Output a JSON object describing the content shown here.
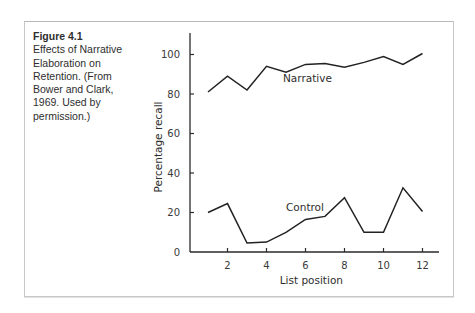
{
  "caption": {
    "figure_number": "Figure 4.1",
    "text": "Effects of Narrative Elaboration on Retention. (From Bower and Clark, 1969. Used by permission.)"
  },
  "colors": {
    "line": "#222222",
    "axis": "#2a2a2a",
    "frame": "#c8c8c8"
  },
  "chart_data": {
    "type": "line",
    "title": "Effects of Narrative Elaboration on Retention",
    "xlabel": "List position",
    "ylabel": "Percentage recall",
    "x": [
      1,
      2,
      3,
      4,
      5,
      6,
      7,
      8,
      9,
      10,
      11,
      12
    ],
    "xticks": [
      2,
      4,
      6,
      8,
      10,
      12
    ],
    "yticks": [
      0,
      20,
      40,
      60,
      80,
      100
    ],
    "xlim": [
      0,
      12.9
    ],
    "ylim": [
      0,
      110
    ],
    "grid": false,
    "legend": "inline labels",
    "series": [
      {
        "name": "Narrative",
        "values": [
          81,
          89,
          82,
          94,
          91,
          95,
          95.5,
          93.5,
          96,
          99,
          95,
          100.5
        ]
      },
      {
        "name": "Control",
        "values": [
          20,
          24.5,
          4.5,
          5,
          10,
          16.5,
          18,
          27.5,
          10,
          10,
          32.5,
          20.5
        ]
      }
    ]
  }
}
